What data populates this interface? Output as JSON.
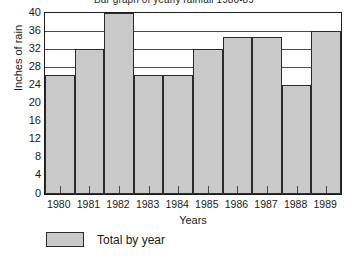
{
  "chart_data": {
    "type": "bar",
    "title": "Bar graph of yearly rainfall 1980-89",
    "xlabel": "Years",
    "ylabel": "Inches of rain",
    "categories": [
      "1980",
      "1981",
      "1982",
      "1983",
      "1984",
      "1985",
      "1986",
      "1987",
      "1988",
      "1989"
    ],
    "values": [
      26.3,
      32,
      40,
      26.3,
      26.3,
      32,
      34.6,
      34.6,
      24.2,
      36
    ],
    "series": [
      {
        "name": "Total by year",
        "values": [
          26.3,
          32,
          40,
          26.3,
          26.3,
          32,
          34.6,
          34.6,
          24.2,
          36
        ]
      }
    ],
    "ylim": [
      0,
      40
    ],
    "yticks": [
      0,
      4,
      8,
      12,
      16,
      20,
      24,
      28,
      32,
      36,
      40
    ],
    "xlim_categories": 10,
    "grid": "horizontal",
    "legend": {
      "position": "below-left",
      "entries": [
        {
          "label": "Total by year",
          "color": "#c9c9c9"
        }
      ]
    },
    "bar_color": "#c9c9c9",
    "bar_border_color": "#2b2b2b",
    "axis_color": "#1e1e1e",
    "background": "#ffffff"
  }
}
